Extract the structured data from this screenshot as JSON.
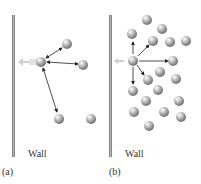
{
  "panel_a": {
    "wall_label": "Wall",
    "caption": "(a)"
  },
  "panel_b": {
    "wall_label": "Wall",
    "caption": "(b)"
  },
  "colors": {
    "wall": "#8a8a8a",
    "molecule": "#9a9a9a",
    "arrow": "#222222",
    "force_arrow": "#c8c8c8"
  }
}
